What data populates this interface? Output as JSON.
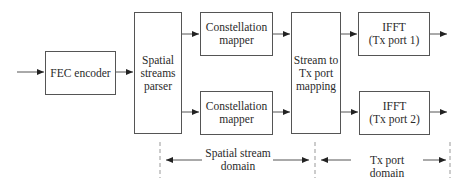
{
  "diagram": {
    "type": "block-diagram",
    "blocks": {
      "fec": "FEC encoder",
      "parser": "Spatial\nstreams\nparser",
      "mapper1": "Constellation\nmapper",
      "mapper2": "Constellation\nmapper",
      "mapping": "Stream to\nTx port\nmapping",
      "ifft1": "IFFT\n(Tx port 1)",
      "ifft2": "IFFT\n(Tx port 2)"
    },
    "domains": {
      "spatial": "Spatial stream\ndomain",
      "tx": "Tx port domain"
    },
    "colors": {
      "line": "#555555",
      "text": "#2a2a2a",
      "dashed": "#999999"
    }
  }
}
